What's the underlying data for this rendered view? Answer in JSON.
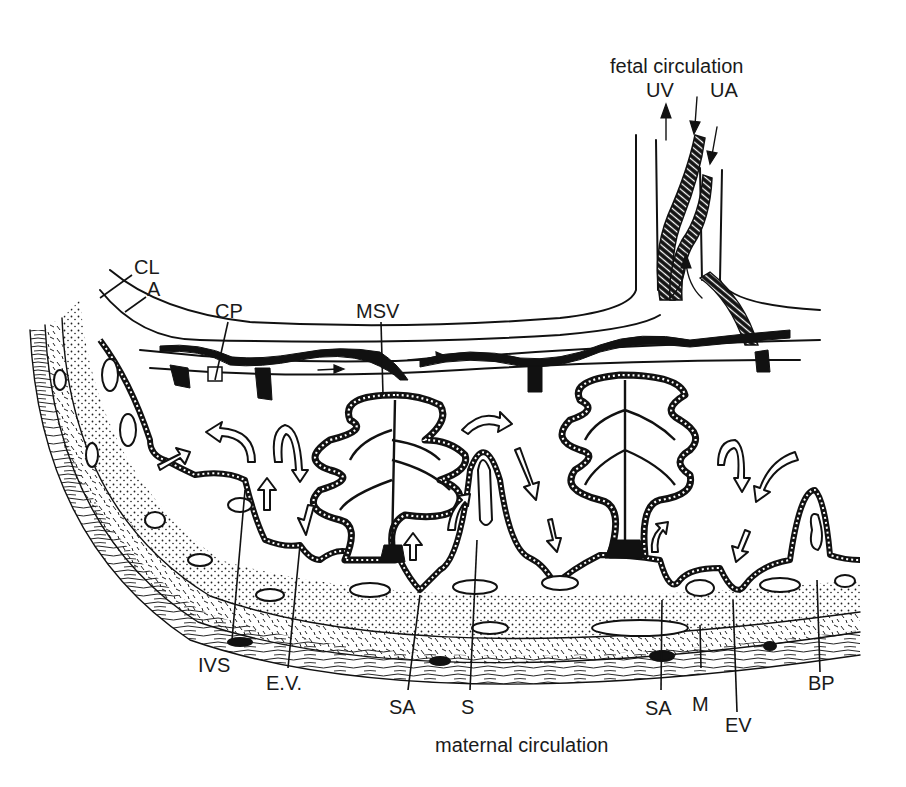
{
  "figure": {
    "type": "anatomical line drawing"
  },
  "captions": {
    "top": "fetal circulation",
    "bottom": "maternal circulation"
  },
  "labels": {
    "UV": "UV",
    "UA": "UA",
    "CL": "CL",
    "A": "A",
    "CP": "CP",
    "MSV": "MSV",
    "IVS": "IVS",
    "EV_dotted": "E.V.",
    "SA_left": "SA",
    "S": "S",
    "SA_right": "SA",
    "M": "M",
    "EV": "EV",
    "BP": "BP"
  },
  "colors": {
    "ink": "#111111",
    "background": "#ffffff"
  }
}
